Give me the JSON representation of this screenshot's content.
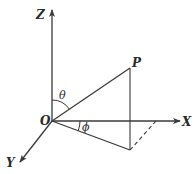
{
  "diagram": {
    "type": "3d-coordinate-spherical",
    "colors": {
      "line": "#3a3a3a",
      "background": "#ffffff"
    },
    "labels": {
      "z_axis": "Z",
      "x_axis": "X",
      "y_axis": "Y",
      "origin": "O",
      "point": "P",
      "polar_angle": "θ",
      "azimuthal_angle": "ϕ"
    }
  }
}
